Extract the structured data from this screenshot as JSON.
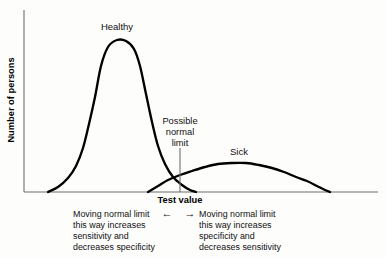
{
  "figure": {
    "axes": {
      "y_label": "Number of persons",
      "x_label": "Test value"
    },
    "curve_labels": {
      "healthy": "Healthy",
      "sick": "Sick"
    },
    "limit_marker": {
      "line1": "Possible",
      "line2": "normal",
      "line3": "limit"
    },
    "annotations": {
      "left_arrow": "←",
      "right_arrow": "→",
      "left": {
        "line1": "Moving normal limit",
        "line2": "this way increases",
        "line3": "sensitivity and",
        "line4": "decreases specificity"
      },
      "right": {
        "line1": "Moving normal limit",
        "line2": "this way increases",
        "line3": "specificity and",
        "line4": "decreases sensitivity"
      }
    },
    "colors": {
      "curve": "#000000",
      "axis": "#6e6e6e",
      "text": "#101010",
      "background": "#fdfdfc"
    }
  },
  "chart_data": {
    "type": "line",
    "title": "",
    "xlabel": "Test value",
    "ylabel": "Number of persons",
    "xlim": [
      0,
      386
    ],
    "ylim": [
      0,
      192
    ],
    "grid": false,
    "legend": "inline-curve-labels",
    "annotations": [
      "Healthy",
      "Sick",
      "Possible normal limit",
      "Moving normal limit this way increases sensitivity and decreases specificity",
      "Moving normal limit this way increases specificity and decreases sensitivity"
    ],
    "axis_geometry": {
      "y_axis_x": 24,
      "y_axis_top": 10,
      "baseline_y": 192,
      "x_axis_right": 378
    },
    "decision_threshold": {
      "name": "Possible normal limit",
      "x": 180,
      "line_top_y": 148,
      "crossing_y": 177
    },
    "series": [
      {
        "name": "Healthy",
        "peak_x": 117,
        "peak_y": 40,
        "baseline_start_x": 48,
        "baseline_end_x": 196,
        "label_x": 117,
        "label_y": 30,
        "points": [
          [
            48,
            192
          ],
          [
            58,
            187
          ],
          [
            68,
            178
          ],
          [
            76,
            166
          ],
          [
            83,
            148
          ],
          [
            89,
            124
          ],
          [
            95,
            97
          ],
          [
            101,
            66
          ],
          [
            108,
            47
          ],
          [
            117,
            40
          ],
          [
            126,
            41
          ],
          [
            134,
            49
          ],
          [
            140,
            66
          ],
          [
            146,
            94
          ],
          [
            152,
            122
          ],
          [
            158,
            146
          ],
          [
            165,
            164
          ],
          [
            173,
            177
          ],
          [
            182,
            185
          ],
          [
            190,
            190
          ],
          [
            196,
            192
          ]
        ]
      },
      {
        "name": "Sick",
        "peak_x": 232,
        "peak_y": 163,
        "baseline_start_x": 148,
        "baseline_end_x": 330,
        "label_x": 239,
        "label_y": 155,
        "points": [
          [
            148,
            192
          ],
          [
            158,
            186
          ],
          [
            168,
            180
          ],
          [
            180,
            175
          ],
          [
            192,
            171
          ],
          [
            205,
            167
          ],
          [
            218,
            164
          ],
          [
            232,
            163
          ],
          [
            246,
            163
          ],
          [
            259,
            165
          ],
          [
            272,
            168
          ],
          [
            284,
            172
          ],
          [
            296,
            177
          ],
          [
            307,
            181
          ],
          [
            317,
            186
          ],
          [
            325,
            190
          ],
          [
            330,
            192
          ]
        ]
      }
    ]
  }
}
